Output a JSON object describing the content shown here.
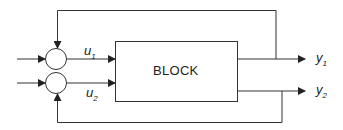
{
  "diagram": {
    "block_label": "BLOCK",
    "inputs": [
      {
        "symbol": "u",
        "subscript": "1"
      },
      {
        "symbol": "u",
        "subscript": "2"
      }
    ],
    "outputs": [
      {
        "symbol": "y",
        "subscript": "1"
      },
      {
        "symbol": "y",
        "subscript": "2"
      }
    ],
    "colors": {
      "line": "#333333",
      "background": "#ffffff"
    }
  }
}
